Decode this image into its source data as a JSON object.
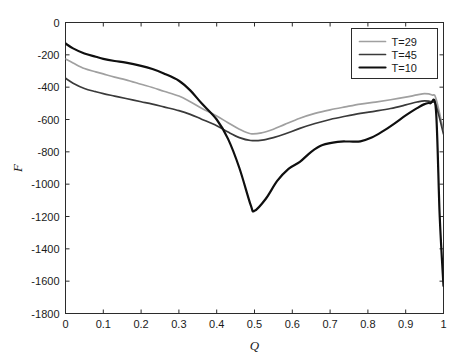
{
  "chart_data": {
    "type": "line",
    "title": "",
    "xlabel": "Q",
    "ylabel": "F",
    "xlim": [
      0,
      1
    ],
    "ylim": [
      -1800,
      0
    ],
    "grid": false,
    "legend_position": "top-right",
    "xticks": [
      "0",
      "0.1",
      "0.2",
      "0.3",
      "0.4",
      "0.5",
      "0.6",
      "0.7",
      "0.8",
      "0.9",
      "1"
    ],
    "xtick_values": [
      0,
      0.1,
      0.2,
      0.3,
      0.4,
      0.5,
      0.6,
      0.7,
      0.8,
      0.9,
      1
    ],
    "yticks": [
      "0",
      "-200",
      "-400",
      "-600",
      "-800",
      "-1000",
      "-1200",
      "-1400",
      "-1600",
      "-1800"
    ],
    "ytick_values": [
      0,
      -200,
      -400,
      -600,
      -800,
      -1000,
      -1200,
      -1400,
      -1600,
      -1800
    ],
    "series": [
      {
        "name": "T=29",
        "color": "#a0a0a0",
        "width": 1.7,
        "x": [
          0,
          0.02,
          0.05,
          0.08,
          0.1,
          0.13,
          0.16,
          0.2,
          0.23,
          0.26,
          0.3,
          0.33,
          0.36,
          0.4,
          0.43,
          0.46,
          0.49,
          0.52,
          0.55,
          0.58,
          0.62,
          0.66,
          0.7,
          0.74,
          0.78,
          0.82,
          0.86,
          0.9,
          0.93,
          0.95,
          0.97,
          0.98,
          1
        ],
        "y": [
          -225,
          -250,
          -285,
          -305,
          -318,
          -338,
          -355,
          -382,
          -402,
          -425,
          -455,
          -490,
          -530,
          -578,
          -620,
          -660,
          -688,
          -682,
          -660,
          -630,
          -592,
          -562,
          -540,
          -522,
          -505,
          -492,
          -478,
          -462,
          -448,
          -440,
          -448,
          -470,
          -670
        ]
      },
      {
        "name": "T=45",
        "color": "#3a3a3a",
        "width": 1.7,
        "x": [
          0,
          0.02,
          0.05,
          0.08,
          0.1,
          0.13,
          0.16,
          0.2,
          0.23,
          0.26,
          0.3,
          0.33,
          0.36,
          0.4,
          0.43,
          0.46,
          0.49,
          0.52,
          0.55,
          0.58,
          0.62,
          0.66,
          0.7,
          0.74,
          0.78,
          0.82,
          0.86,
          0.9,
          0.93,
          0.95,
          0.97,
          0.98,
          1
        ],
        "y": [
          -345,
          -375,
          -408,
          -428,
          -440,
          -455,
          -470,
          -490,
          -505,
          -522,
          -545,
          -568,
          -598,
          -638,
          -678,
          -712,
          -730,
          -728,
          -712,
          -690,
          -655,
          -625,
          -600,
          -580,
          -562,
          -548,
          -532,
          -510,
          -492,
          -485,
          -492,
          -510,
          -690
        ]
      },
      {
        "name": "T=10",
        "color": "#0f0f0f",
        "width": 2.2,
        "x": [
          0,
          0.02,
          0.05,
          0.08,
          0.1,
          0.13,
          0.16,
          0.2,
          0.23,
          0.26,
          0.3,
          0.33,
          0.36,
          0.4,
          0.43,
          0.46,
          0.49,
          0.5,
          0.53,
          0.56,
          0.59,
          0.62,
          0.65,
          0.68,
          0.72,
          0.75,
          0.78,
          0.81,
          0.84,
          0.87,
          0.9,
          0.93,
          0.95,
          0.965,
          0.98,
          0.99,
          1
        ],
        "y": [
          -130,
          -160,
          -192,
          -212,
          -225,
          -238,
          -248,
          -268,
          -288,
          -315,
          -360,
          -420,
          -500,
          -600,
          -720,
          -900,
          -1130,
          -1165,
          -1090,
          -980,
          -905,
          -862,
          -800,
          -758,
          -738,
          -736,
          -735,
          -712,
          -672,
          -625,
          -575,
          -530,
          -505,
          -500,
          -540,
          -1200,
          -1630
        ]
      }
    ]
  },
  "axes": {
    "x_axis_label": "Q",
    "y_axis_label": "F"
  },
  "legend": {
    "entries": [
      {
        "label": "T=29"
      },
      {
        "label": "T=45"
      },
      {
        "label": "T=10"
      }
    ]
  }
}
